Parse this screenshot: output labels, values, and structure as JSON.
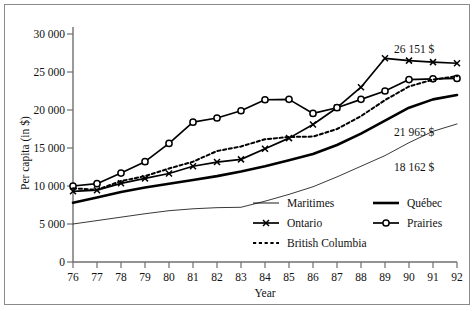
{
  "chart_data": {
    "type": "line",
    "title": "",
    "xlabel": "Year",
    "ylabel": "Per capita (in $)",
    "x": [
      76,
      77,
      78,
      79,
      80,
      81,
      82,
      83,
      84,
      85,
      86,
      87,
      88,
      89,
      90,
      91,
      92
    ],
    "xtick_labels": [
      "76",
      "77",
      "78",
      "79",
      "80",
      "81",
      "82",
      "83",
      "84",
      "85",
      "86",
      "87",
      "88",
      "89",
      "90",
      "91",
      "92"
    ],
    "ytick_labels": [
      "0",
      "5 000",
      "10 000",
      "15 000",
      "20 000",
      "25 000",
      "30 000"
    ],
    "ytick_values": [
      0,
      5000,
      10000,
      15000,
      20000,
      25000,
      30000
    ],
    "xlim": [
      76,
      92
    ],
    "ylim": [
      0,
      30000
    ],
    "grid": false,
    "legend_position": "inside-bottom",
    "series": [
      {
        "name": "Maritimes",
        "style": "thin-solid",
        "marker": "none",
        "color": "#222222",
        "values": [
          5000,
          5450,
          5900,
          6350,
          6750,
          7000,
          7150,
          7200,
          8000,
          8900,
          9900,
          11200,
          12600,
          14000,
          15700,
          17200,
          18162
        ]
      },
      {
        "name": "Québec",
        "style": "thick-solid",
        "marker": "none",
        "color": "#000000",
        "values": [
          7800,
          8500,
          9200,
          9800,
          10300,
          10800,
          11300,
          11900,
          12600,
          13400,
          14200,
          15400,
          16900,
          18600,
          20300,
          21400,
          21965
        ]
      },
      {
        "name": "Ontario",
        "style": "solid",
        "marker": "cross",
        "color": "#000000",
        "values": [
          9300,
          9450,
          10350,
          11000,
          11650,
          12600,
          13150,
          13500,
          14900,
          16300,
          18100,
          20300,
          23000,
          26800,
          26500,
          26300,
          26151
        ]
      },
      {
        "name": "Prairies",
        "style": "solid",
        "marker": "circle",
        "color": "#000000",
        "values": [
          10000,
          10300,
          11700,
          13200,
          15600,
          18400,
          18950,
          19900,
          21350,
          21400,
          19550,
          20300,
          21400,
          22500,
          24000,
          24100,
          24150
        ]
      },
      {
        "name": "British Columbia",
        "style": "dotted",
        "marker": "none",
        "color": "#000000",
        "values": [
          9700,
          9500,
          10650,
          11300,
          12300,
          13200,
          14600,
          15200,
          16150,
          16450,
          16500,
          17500,
          19200,
          21300,
          23100,
          24000,
          24450
        ]
      }
    ],
    "annotations": [
      {
        "text": "26 151 $",
        "series": "Ontario",
        "x": 92
      },
      {
        "text": "21 965 $",
        "series": "Québec",
        "x": 92
      },
      {
        "text": "18 162 $",
        "series": "Maritimes",
        "x": 92
      }
    ]
  },
  "legend": {
    "entries": [
      {
        "label": "Maritimes",
        "key": "maritimes"
      },
      {
        "label": "Québec",
        "key": "quebec"
      },
      {
        "label": "Ontario",
        "key": "ontario"
      },
      {
        "label": "Prairies",
        "key": "prairies"
      },
      {
        "label": "British Columbia",
        "key": "british-columbia"
      }
    ]
  }
}
